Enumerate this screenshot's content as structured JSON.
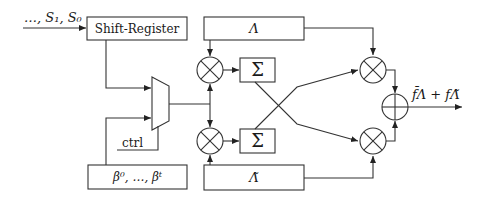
{
  "diagram": {
    "input_label": "…, S₁, S₀",
    "shift_register_label": "Shift-Register",
    "lambda_label": "Λ",
    "lambda_tilde_label": "Λ̃",
    "beta_label": "β⁰, …, βᵗ",
    "ctrl_label": "ctrl",
    "sum_top_label": "Σ",
    "sum_bottom_label": "Σ",
    "output_label": "f̄Λ + fΛ̃",
    "colors": {
      "stroke": "#333333",
      "text": "#1a1a1a",
      "background": "#ffffff"
    }
  }
}
